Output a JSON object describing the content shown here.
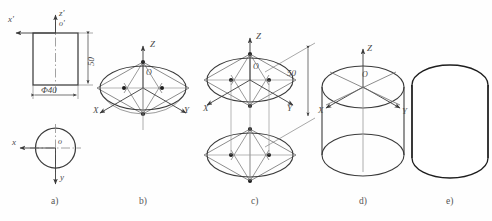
{
  "figure": {
    "background_color": "#fefefe",
    "line_color": "#3b3b3b",
    "thin_line_color": "#6e6e6e",
    "text_color": "#4a4a4a"
  },
  "steps": [
    {
      "key": "a",
      "label": "a)",
      "caption_x": 55,
      "caption_y": 200,
      "description": "Orthographic views: front rectangle with diameter and height, top circular view"
    },
    {
      "key": "b",
      "label": "b)",
      "caption_x": 143,
      "caption_y": 200,
      "description": "Isometric axes with rhombus and four-center ellipse construction for top face"
    },
    {
      "key": "c",
      "label": "c)",
      "caption_x": 255,
      "caption_y": 200,
      "description": "Top and bottom ellipses offset by the cylinder height of 50"
    },
    {
      "key": "d",
      "label": "d)",
      "caption_x": 363,
      "caption_y": 200,
      "description": "Ellipses joined by tangent outlines with isometric axes retained"
    },
    {
      "key": "e",
      "label": "e)",
      "caption_x": 450,
      "caption_y": 200,
      "description": "Finished isometric cylinder with construction lines removed"
    }
  ],
  "view_a": {
    "axis_labels": [
      {
        "text": "x'",
        "x": 10,
        "y": 20
      },
      {
        "text": "z'",
        "x": 60,
        "y": 12
      },
      {
        "text": "o'",
        "x": 60,
        "y": 22
      },
      {
        "text": "x",
        "x": 12,
        "y": 138
      },
      {
        "text": "o",
        "x": 59,
        "y": 137
      },
      {
        "text": "y",
        "x": 61,
        "y": 180
      }
    ],
    "dimensions": [
      {
        "name": "diameter",
        "text": "Φ40",
        "x": 42,
        "y": 90
      },
      {
        "name": "height",
        "text": "50",
        "x": 80,
        "y": 50
      }
    ]
  },
  "view_b": {
    "axis_labels": [
      {
        "text": "Z",
        "x": 151,
        "y": 41
      },
      {
        "text": "X",
        "x": 94,
        "y": 110
      },
      {
        "text": "Y",
        "x": 185,
        "y": 110
      },
      {
        "text": "O",
        "x": 148,
        "y": 72
      }
    ]
  },
  "view_c": {
    "axis_labels": [
      {
        "text": "Z",
        "x": 257,
        "y": 34
      },
      {
        "text": "X",
        "x": 204,
        "y": 111
      },
      {
        "text": "Y",
        "x": 288,
        "y": 109
      },
      {
        "text": "O",
        "x": 255,
        "y": 66
      }
    ],
    "dimensions": [
      {
        "name": "height",
        "text": "50",
        "x": 293,
        "y": 72
      }
    ]
  },
  "view_d": {
    "axis_labels": [
      {
        "text": "Z",
        "x": 368,
        "y": 45
      },
      {
        "text": "X",
        "x": 320,
        "y": 113
      },
      {
        "text": "Y",
        "x": 405,
        "y": 114
      },
      {
        "text": "O",
        "x": 364,
        "y": 74
      }
    ]
  },
  "view_e": {
    "axis_labels": []
  }
}
